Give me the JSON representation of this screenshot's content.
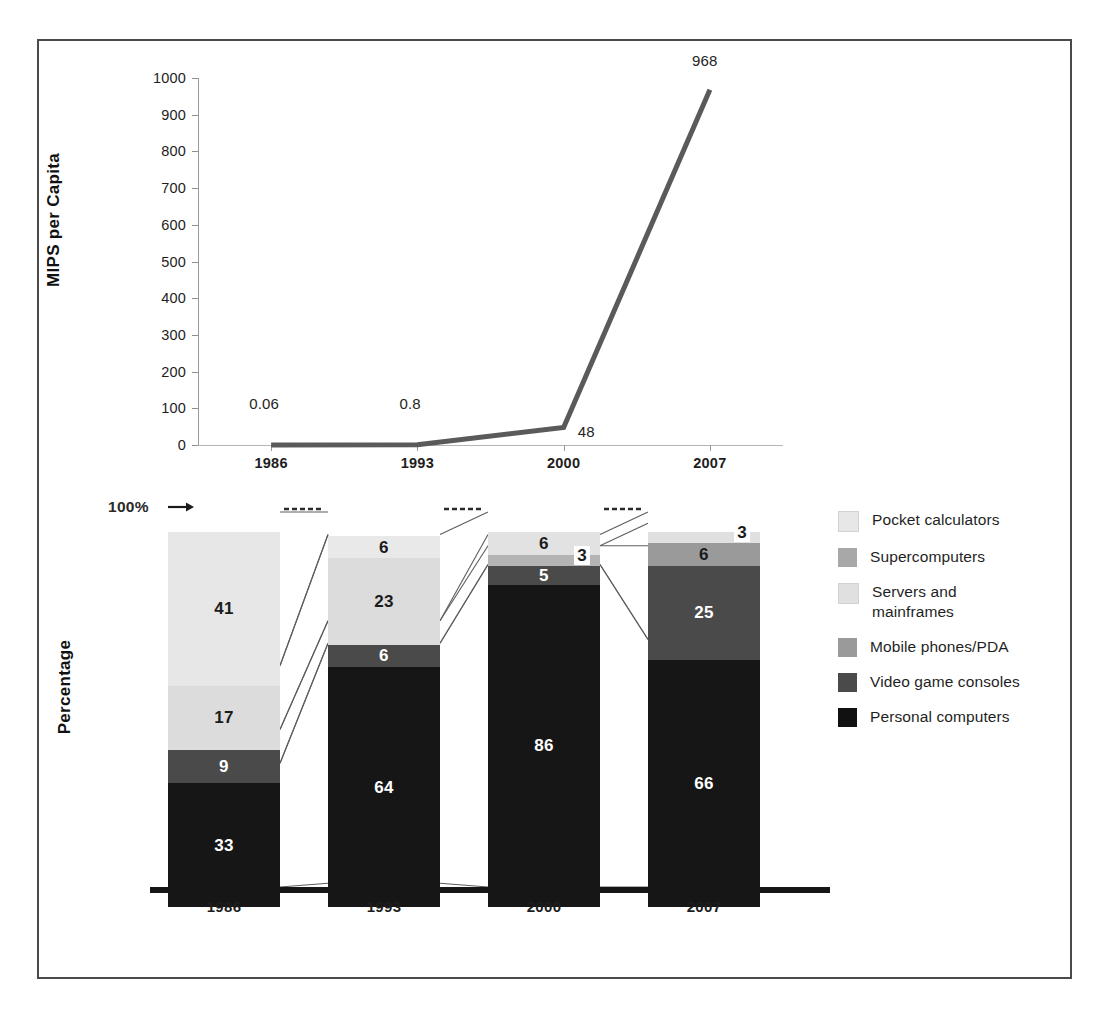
{
  "chart_data": [
    {
      "type": "line",
      "title": "",
      "xlabel": "",
      "ylabel": "MIPS per Capita",
      "categories": [
        "1986",
        "1993",
        "2000",
        "2007"
      ],
      "x": [
        1986,
        1993,
        2000,
        2007
      ],
      "values": [
        0.06,
        0.8,
        48,
        968
      ],
      "point_labels": [
        "0.06",
        "0.8",
        "48",
        "968"
      ],
      "yticks": [
        "1000",
        "900",
        "800",
        "700",
        "600",
        "500",
        "400",
        "300",
        "200",
        "100",
        "0"
      ],
      "ylim": [
        0,
        1000
      ],
      "grid": false,
      "legend": "none",
      "line_color": "#5a5a5a"
    },
    {
      "type": "bar",
      "subtype": "stacked-100-percent",
      "title": "",
      "xlabel": "",
      "ylabel": "Percentage",
      "axis_note": "100%",
      "categories": [
        "1986",
        "1993",
        "2000",
        "2007"
      ],
      "ylim": [
        0,
        100
      ],
      "grid": false,
      "legend": "right",
      "series": [
        {
          "name": "Pocket calculators",
          "color": "#e7e7e7",
          "values": [
            41,
            6,
            0,
            0
          ]
        },
        {
          "name": "Supercomputers",
          "color": "#a8a8a8",
          "values": [
            0,
            0,
            3,
            3
          ]
        },
        {
          "name": "Servers and mainframes",
          "color": "#dcdcdc",
          "values": [
            17,
            23,
            6,
            0
          ]
        },
        {
          "name": "Mobile phones/PDA",
          "color": "#9a9a9a",
          "values": [
            0,
            0,
            0,
            6
          ]
        },
        {
          "name": "Video game consoles",
          "color": "#4a4a4a",
          "values": [
            9,
            6,
            5,
            25
          ]
        },
        {
          "name": "Personal computers",
          "color": "#161616",
          "values": [
            33,
            64,
            86,
            66
          ]
        }
      ],
      "bars": [
        {
          "year": "1986",
          "segments": [
            {
              "series": "Pocket calculators",
              "value": 41,
              "label": "41",
              "color": "#e7e7e7",
              "label_style": "dark"
            },
            {
              "series": "Servers and mainframes",
              "value": 17,
              "label": "17",
              "color": "#dcdcdc",
              "label_style": "dark"
            },
            {
              "series": "Video game consoles",
              "value": 9,
              "label": "9",
              "color": "#4a4a4a",
              "label_style": "light"
            },
            {
              "series": "Personal computers",
              "value": 33,
              "label": "33",
              "color": "#161616",
              "label_style": "light"
            }
          ]
        },
        {
          "year": "1993",
          "segments": [
            {
              "series": "Pocket calculators",
              "value": 6,
              "label": "6",
              "color": "#e9e9e9",
              "label_style": "dark"
            },
            {
              "series": "Servers and mainframes",
              "value": 23,
              "label": "23",
              "color": "#dcdcdc",
              "label_style": "dark"
            },
            {
              "series": "Video game consoles",
              "value": 6,
              "label": "6",
              "color": "#4a4a4a",
              "label_style": "light"
            },
            {
              "series": "Personal computers",
              "value": 64,
              "label": "64",
              "color": "#161616",
              "label_style": "light"
            }
          ]
        },
        {
          "year": "2000",
          "segments": [
            {
              "series": "Servers and mainframes",
              "value": 6,
              "label": "6",
              "color": "#e2e2e2",
              "label_style": "dark"
            },
            {
              "series": "Supercomputers",
              "value": 3,
              "label": "3",
              "color": "#b4b4b4",
              "label_style": "callout"
            },
            {
              "series": "Video game consoles",
              "value": 5,
              "label": "5",
              "color": "#4a4a4a",
              "label_style": "chip"
            },
            {
              "series": "Personal computers",
              "value": 86,
              "label": "86",
              "color": "#161616",
              "label_style": "light"
            }
          ]
        },
        {
          "year": "2007",
          "segments": [
            {
              "series": "Supercomputers",
              "value": 3,
              "label": "3",
              "color": "#e0e0e0",
              "label_style": "callout"
            },
            {
              "series": "Mobile phones/PDA",
              "value": 6,
              "label": "6",
              "color": "#9a9a9a",
              "label_style": "dark"
            },
            {
              "series": "Video game consoles",
              "value": 25,
              "label": "25",
              "color": "#4a4a4a",
              "label_style": "light"
            },
            {
              "series": "Personal computers",
              "value": 66,
              "label": "66",
              "color": "#161616",
              "label_style": "light"
            }
          ]
        }
      ]
    }
  ],
  "line_chart": {
    "axis_label": "MIPS per Capita",
    "yticks": [
      "1000",
      "900",
      "800",
      "700",
      "600",
      "500",
      "400",
      "300",
      "200",
      "100",
      "0"
    ],
    "xticks": [
      "1986",
      "1993",
      "2000",
      "2007"
    ],
    "point_labels": [
      "0.06",
      "0.8",
      "48",
      "968"
    ]
  },
  "bar_chart": {
    "axis_label": "Percentage",
    "top_marker": "100%",
    "xticks": [
      "1986",
      "1993",
      "2000",
      "2007"
    ]
  },
  "legend": {
    "items": [
      {
        "label": "Pocket calculators",
        "color": "#e7e7e7"
      },
      {
        "label": "Supercomputers",
        "color": "#a8a8a8"
      },
      {
        "label": "Servers and\nmainframes",
        "color": "#e0e0e0"
      },
      {
        "label": "Mobile phones/PDA",
        "color": "#9a9a9a"
      },
      {
        "label": "Video game consoles",
        "color": "#4a4a4a"
      },
      {
        "label": "Personal computers",
        "color": "#111111"
      }
    ]
  }
}
